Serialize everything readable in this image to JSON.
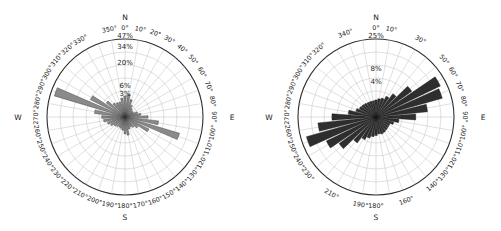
{
  "figure": {
    "kind": "wind-rose-pair",
    "background": "#ffffff",
    "panels": [
      "left",
      "right"
    ]
  },
  "chart_data": [
    {
      "type": "pie",
      "subtype": "wind-rose",
      "panel": "left",
      "title": "",
      "xlabel": "",
      "ylabel": "",
      "grid": true,
      "legend": "none",
      "petal_color": "#8a8a8a",
      "petal_edge": "#2f2f2f",
      "angle_unit": "degrees",
      "angle_zero": "North (top)",
      "angle_direction": "clockwise",
      "cardinals": [
        "N",
        "E",
        "S",
        "W"
      ],
      "radial_ticks": [
        3,
        6,
        20,
        34,
        47
      ],
      "radial_tick_labels": [
        "3%",
        "6%",
        "20%",
        "34%",
        "47%"
      ],
      "rlim": [
        0,
        47
      ],
      "degree_labels": [
        "0°",
        "10°",
        "20°",
        "30°",
        "40°",
        "50°",
        "60°",
        "70°",
        "80°",
        "90°",
        "100°",
        "110°",
        "120°",
        "130°",
        "140°",
        "150°",
        "160°",
        "170°",
        "180°",
        "190°",
        "200°",
        "210°",
        "220°",
        "230°",
        "240°",
        "250°",
        "260°",
        "270°",
        "280°",
        "290°",
        "300°",
        "310°",
        "320°",
        "330°",
        "350°"
      ],
      "categories": [
        0,
        10,
        20,
        30,
        40,
        50,
        60,
        70,
        80,
        90,
        100,
        110,
        120,
        130,
        140,
        150,
        160,
        170,
        180,
        190,
        200,
        210,
        220,
        230,
        240,
        250,
        260,
        270,
        280,
        290,
        300,
        310,
        320,
        330,
        340,
        350
      ],
      "values": [
        3.4,
        4.0,
        2.6,
        1.4,
        0.9,
        0.7,
        0.7,
        1.3,
        2.0,
        4.1,
        8.8,
        25.0,
        5.5,
        2.0,
        1.3,
        1.0,
        1.2,
        2.6,
        2.2,
        1.4,
        1.1,
        1.0,
        1.1,
        1.4,
        2.0,
        2.6,
        3.6,
        4.2,
        7.3,
        42.0,
        11.5,
        4.2,
        2.4,
        2.0,
        1.9,
        2.8
      ]
    },
    {
      "type": "pie",
      "subtype": "wind-rose",
      "panel": "right",
      "title": "",
      "xlabel": "",
      "ylabel": "",
      "grid": true,
      "legend": "none",
      "petal_color": "#2e2e2e",
      "petal_edge": "#161616",
      "angle_unit": "degrees",
      "angle_zero": "North (top)",
      "angle_direction": "clockwise",
      "cardinals": [
        "N",
        "E",
        "S",
        "W"
      ],
      "radial_ticks": [
        4,
        8,
        25
      ],
      "radial_tick_labels": [
        "4%",
        "8%",
        "25%"
      ],
      "rlim": [
        0,
        25
      ],
      "degree_labels": [
        "0°",
        "10°",
        "30°",
        "50°",
        "60°",
        "70°",
        "80°",
        "90°",
        "100°",
        "110°",
        "120°",
        "130°",
        "140°",
        "160°",
        "180°",
        "190°",
        "210°",
        "230°",
        "240°",
        "250°",
        "260°",
        "270°",
        "280°",
        "290°",
        "300°",
        "310°",
        "320°",
        "340°"
      ],
      "categories": [
        0,
        10,
        20,
        30,
        40,
        50,
        60,
        70,
        80,
        90,
        100,
        110,
        120,
        130,
        140,
        150,
        160,
        170,
        180,
        190,
        200,
        210,
        220,
        230,
        240,
        250,
        260,
        270,
        280,
        290,
        300,
        310,
        320,
        330,
        340,
        350
      ],
      "values": [
        1.2,
        1.4,
        1.6,
        2.2,
        3.4,
        8.0,
        21.0,
        19.5,
        11.0,
        6.5,
        2.2,
        1.4,
        1.0,
        1.0,
        1.1,
        1.2,
        1.3,
        1.2,
        1.4,
        1.6,
        2.0,
        2.6,
        4.2,
        8.5,
        12.5,
        21.5,
        14.0,
        8.0,
        3.2,
        1.8,
        1.4,
        1.3,
        1.2,
        1.1,
        1.1,
        1.1
      ]
    }
  ]
}
